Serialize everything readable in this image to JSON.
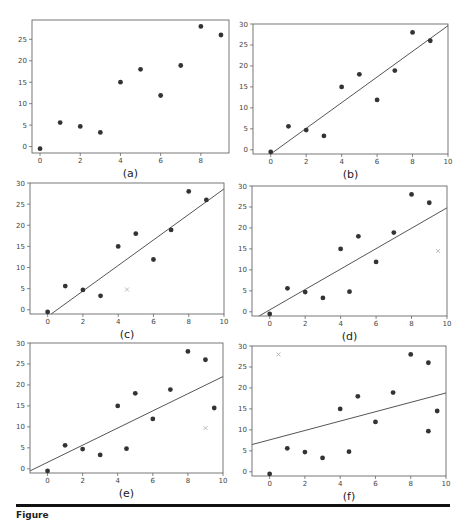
{
  "figure": {
    "caption_partial": "Figure"
  },
  "chart_data": [
    {
      "panel": "a",
      "label": "(a)",
      "type": "scatter",
      "box": {
        "x0": 32,
        "y0": 20,
        "x1": 229,
        "y1": 153
      },
      "xlim": [
        -0.4,
        9.4
      ],
      "ylim": [
        -1.5,
        29.5
      ],
      "xticks": [
        0,
        2,
        4,
        6,
        8
      ],
      "yticks": [
        0,
        5,
        10,
        15,
        20,
        25
      ],
      "points": [
        [
          0,
          -0.5
        ],
        [
          1,
          5.6
        ],
        [
          2,
          4.7
        ],
        [
          3,
          3.3
        ],
        [
          4,
          15
        ],
        [
          5,
          18
        ],
        [
          6,
          11.9
        ],
        [
          7,
          18.9
        ],
        [
          8,
          28
        ],
        [
          9,
          26
        ]
      ],
      "outliers": [],
      "line": null
    },
    {
      "panel": "b",
      "label": "(b)",
      "type": "scatter",
      "box": {
        "x0": 253,
        "y0": 24,
        "x1": 448,
        "y1": 154
      },
      "xlim": [
        -1,
        10
      ],
      "ylim": [
        -1,
        30
      ],
      "xticks": [
        0,
        2,
        4,
        6,
        8,
        10
      ],
      "yticks": [
        0,
        5,
        10,
        15,
        20,
        25,
        30
      ],
      "points": [
        [
          0,
          -0.5
        ],
        [
          1,
          5.6
        ],
        [
          2,
          4.7
        ],
        [
          3,
          3.3
        ],
        [
          4,
          15
        ],
        [
          5,
          18
        ],
        [
          6,
          11.9
        ],
        [
          7,
          18.9
        ],
        [
          8,
          28
        ],
        [
          9,
          26
        ]
      ],
      "outliers": [],
      "line": {
        "x": [
          0,
          10
        ],
        "y": [
          -1,
          29.6
        ]
      }
    },
    {
      "panel": "c",
      "label": "(c)",
      "type": "scatter",
      "box": {
        "x0": 30,
        "y0": 183,
        "x1": 224,
        "y1": 314
      },
      "xlim": [
        -1,
        10
      ],
      "ylim": [
        -1,
        30
      ],
      "xticks": [
        0,
        2,
        4,
        6,
        8,
        10
      ],
      "yticks": [
        0,
        5,
        10,
        15,
        20,
        25,
        30
      ],
      "points": [
        [
          0,
          -0.5
        ],
        [
          1,
          5.6
        ],
        [
          2,
          4.7
        ],
        [
          3,
          3.3
        ],
        [
          4,
          15
        ],
        [
          5,
          18
        ],
        [
          6,
          11.9
        ],
        [
          7,
          18.9
        ],
        [
          8,
          28
        ],
        [
          9,
          26
        ]
      ],
      "outliers": [
        [
          4.5,
          4.8
        ]
      ],
      "line": {
        "x": [
          0.2,
          10
        ],
        "y": [
          -1,
          28.6
        ]
      }
    },
    {
      "panel": "d",
      "label": "(d)",
      "type": "scatter",
      "box": {
        "x0": 252,
        "y0": 186,
        "x1": 447,
        "y1": 316
      },
      "xlim": [
        -1,
        10
      ],
      "ylim": [
        -1,
        30
      ],
      "xticks": [
        0,
        2,
        4,
        6,
        8,
        10
      ],
      "yticks": [
        0,
        5,
        10,
        15,
        20,
        25,
        30
      ],
      "points": [
        [
          0,
          -0.5
        ],
        [
          1,
          5.6
        ],
        [
          2,
          4.7
        ],
        [
          3,
          3.3
        ],
        [
          4,
          15
        ],
        [
          4.5,
          4.8
        ],
        [
          5,
          18
        ],
        [
          6,
          11.9
        ],
        [
          7,
          18.9
        ],
        [
          8,
          28
        ],
        [
          9,
          26
        ]
      ],
      "outliers": [
        [
          9.5,
          14.5
        ]
      ],
      "line": {
        "x": [
          -0.6,
          10
        ],
        "y": [
          -1,
          24.8
        ]
      }
    },
    {
      "panel": "e",
      "label": "(e)",
      "type": "scatter",
      "box": {
        "x0": 30,
        "y0": 343,
        "x1": 223,
        "y1": 473
      },
      "xlim": [
        -1,
        10
      ],
      "ylim": [
        -1,
        30
      ],
      "xticks": [
        0,
        2,
        4,
        6,
        8,
        10
      ],
      "yticks": [
        0,
        5,
        10,
        15,
        20,
        25,
        30
      ],
      "points": [
        [
          0,
          -0.5
        ],
        [
          1,
          5.6
        ],
        [
          2,
          4.7
        ],
        [
          3,
          3.3
        ],
        [
          4,
          15
        ],
        [
          4.5,
          4.8
        ],
        [
          5,
          18
        ],
        [
          6,
          11.9
        ],
        [
          7,
          18.9
        ],
        [
          8,
          28
        ],
        [
          9,
          26
        ],
        [
          9.5,
          14.5
        ]
      ],
      "outliers": [
        [
          9,
          9.7
        ]
      ],
      "line": {
        "x": [
          -1,
          10
        ],
        "y": [
          -0.5,
          22
        ]
      }
    },
    {
      "panel": "f",
      "label": "(f)",
      "type": "scatter",
      "box": {
        "x0": 252,
        "y0": 346,
        "x1": 446,
        "y1": 476
      },
      "xlim": [
        -1,
        10
      ],
      "ylim": [
        -1,
        30
      ],
      "xticks": [
        0,
        2,
        4,
        6,
        8,
        10
      ],
      "yticks": [
        0,
        5,
        10,
        15,
        20,
        25,
        30
      ],
      "points": [
        [
          0,
          -0.5
        ],
        [
          1,
          5.6
        ],
        [
          2,
          4.7
        ],
        [
          3,
          3.3
        ],
        [
          4,
          15
        ],
        [
          4.5,
          4.8
        ],
        [
          5,
          18
        ],
        [
          6,
          11.9
        ],
        [
          7,
          18.9
        ],
        [
          8,
          28
        ],
        [
          9,
          26
        ],
        [
          9.5,
          14.5
        ],
        [
          9,
          9.7
        ]
      ],
      "outliers": [
        [
          0.5,
          28
        ]
      ],
      "line": {
        "x": [
          -1,
          10
        ],
        "y": [
          6.5,
          18.8
        ]
      }
    }
  ],
  "colors": {
    "point": "#333333",
    "outlier": "#aaaaaa",
    "line": "#555555",
    "axis": "#555555"
  }
}
